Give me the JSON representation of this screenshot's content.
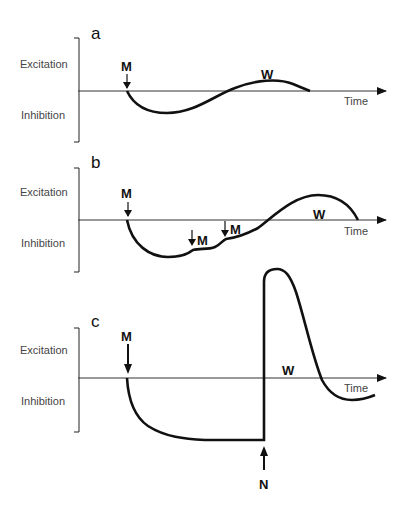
{
  "labels": {
    "excitation": "Excitation",
    "inhibition": "Inhibition",
    "time": "Time",
    "m": "M",
    "w": "W",
    "n": "N"
  },
  "panels": [
    {
      "id": "a",
      "label": "a",
      "markers": [
        "M"
      ],
      "wave_label": "W"
    },
    {
      "id": "b",
      "label": "b",
      "markers": [
        "M",
        "M",
        "M"
      ],
      "wave_label": "W"
    },
    {
      "id": "c",
      "label": "c",
      "markers": [
        "M",
        "N"
      ],
      "wave_label": "W"
    }
  ]
}
